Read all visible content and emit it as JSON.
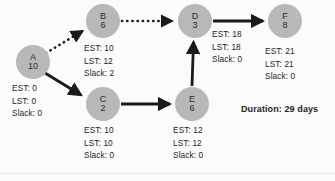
{
  "diagram": {
    "type": "pert-cpm-network",
    "background_color": "#fbfbfb",
    "node_color": "#b8b8b8",
    "text_color": "#231f20",
    "edge_color": "#1a1a1a",
    "duration_label": "Duration: 29 days",
    "stat_labels": {
      "est": "EST:",
      "lst": "LST:",
      "slack": "Slack:"
    },
    "nodes": [
      {
        "id": "A",
        "duration": "10",
        "x": 33,
        "y": 62,
        "est": "0",
        "lst": "0",
        "slack": "0",
        "est_line": "EST: 0",
        "lst_line": "LST: 0",
        "slack_line": "Slack: 0",
        "stats_x": 12,
        "stats_y": 82
      },
      {
        "id": "B",
        "duration": "6",
        "x": 103,
        "y": 21,
        "est": "10",
        "lst": "12",
        "slack": "2",
        "est_line": "EST: 10",
        "lst_line": "LST: 12",
        "slack_line": "Slack: 2",
        "stats_x": 84,
        "stats_y": 42
      },
      {
        "id": "C",
        "duration": "2",
        "x": 103,
        "y": 104,
        "est": "10",
        "lst": "10",
        "slack": "0",
        "est_line": "EST: 10",
        "lst_line": "LST: 10",
        "slack_line": "Slack: 0",
        "stats_x": 84,
        "stats_y": 124
      },
      {
        "id": "D",
        "duration": "3",
        "x": 195,
        "y": 21,
        "est": "18",
        "lst": "18",
        "slack": "0",
        "est_line": "EST: 18",
        "lst_line": "LST: 18",
        "slack_line": "Slack: 0",
        "stats_x": 212,
        "stats_y": 28
      },
      {
        "id": "E",
        "duration": "6",
        "x": 192,
        "y": 104,
        "est": "12",
        "lst": "12",
        "slack": "0",
        "est_line": "EST: 12",
        "lst_line": "LST: 12",
        "slack_line": "Slack: 0",
        "stats_x": 173,
        "stats_y": 124
      },
      {
        "id": "F",
        "duration": "8",
        "x": 285,
        "y": 21,
        "est": "21",
        "lst": "21",
        "slack": "0",
        "est_line": "EST: 21",
        "lst_line": "LST: 21",
        "slack_line": "Slack: 0",
        "stats_x": 265,
        "stats_y": 45
      }
    ],
    "edges": [
      {
        "from": "A",
        "to": "B",
        "style": "dotted"
      },
      {
        "from": "A",
        "to": "C",
        "style": "solid"
      },
      {
        "from": "B",
        "to": "D",
        "style": "dotted"
      },
      {
        "from": "C",
        "to": "E",
        "style": "solid"
      },
      {
        "from": "E",
        "to": "D",
        "style": "solid"
      },
      {
        "from": "D",
        "to": "F",
        "style": "solid"
      }
    ]
  }
}
